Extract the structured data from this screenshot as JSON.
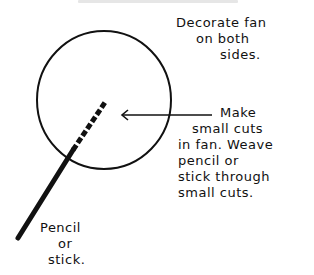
{
  "diagram": {
    "colors": {
      "ink": "#111111",
      "background": "#ffffff"
    },
    "notes": {
      "decorate": {
        "lines": [
          "Decorate fan",
          "on both",
          "sides."
        ]
      },
      "cuts": {
        "lines": [
          "Make",
          "small cuts",
          "in fan. Weave",
          "pencil or",
          "stick through",
          "small cuts."
        ]
      },
      "stick": {
        "lines": [
          "Pencil",
          "or",
          "stick."
        ]
      }
    },
    "shapes": {
      "fan_circle": {
        "cx": 104,
        "cy": 100,
        "rx": 67,
        "ry": 69
      },
      "arrow": {
        "x1": 212,
        "y1": 115,
        "x2": 122,
        "y2": 115
      },
      "stick": {
        "x1": 18,
        "y1": 238,
        "x2": 73,
        "y2": 150
      },
      "cuts_line": {
        "x1": 73,
        "y1": 150,
        "x2": 106,
        "y2": 102,
        "dash_count": 6
      }
    }
  }
}
